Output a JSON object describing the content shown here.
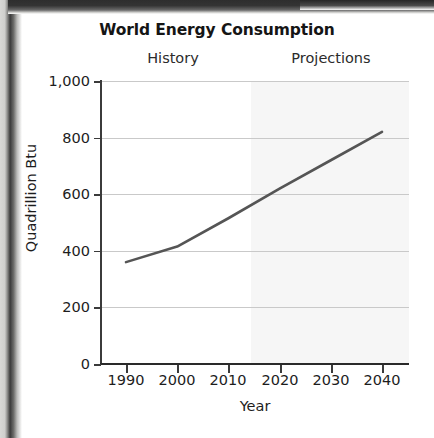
{
  "chart_data": {
    "type": "line",
    "title": "World Energy Consumption",
    "xlabel": "Year",
    "ylabel": "Quadrillion Btu",
    "x": [
      1990,
      2000,
      2010,
      2020,
      2030,
      2040
    ],
    "values": [
      360,
      415,
      515,
      620,
      720,
      820
    ],
    "series": [
      {
        "name": "World Energy Consumption",
        "values": [
          360,
          415,
          515,
          620,
          720,
          820
        ],
        "color": "#555555"
      }
    ],
    "xlim": [
      1988,
      2042
    ],
    "ylim": [
      0,
      1000
    ],
    "xtick_labels": [
      "1990",
      "2000",
      "2010",
      "2020",
      "2030",
      "2040"
    ],
    "ytick_labels": [
      "0",
      "200",
      "400",
      "600",
      "800",
      "1,000"
    ],
    "ytick_values": [
      0,
      200,
      400,
      600,
      800,
      1000
    ],
    "grid": "horizontal",
    "legend": "none",
    "annotations": [
      {
        "text": "History",
        "region": [
          1988,
          2015
        ]
      },
      {
        "text": "Projections",
        "region": [
          2015,
          2042
        ]
      }
    ],
    "shaded_region": {
      "label": "Projections",
      "from_year": 2015,
      "to_year": 2042,
      "color": "#f6f6f6"
    }
  },
  "labels": {
    "title": "World Energy Consumption",
    "history": "History",
    "projections": "Projections",
    "y_axis_title": "Quadrillion Btu",
    "x_axis_title": "Year",
    "y_ticks": [
      "1,000",
      "800",
      "600",
      "400",
      "200",
      "0"
    ],
    "x_ticks": [
      "1990",
      "2000",
      "2010",
      "2020",
      "2030",
      "2040"
    ]
  },
  "colors": {
    "line": "#555555",
    "gridline": "#c9c9c9",
    "axis": "#3b3b3b",
    "shade": "#f6f6f6",
    "text": "#1d1d1d",
    "page": "#ffffff"
  }
}
